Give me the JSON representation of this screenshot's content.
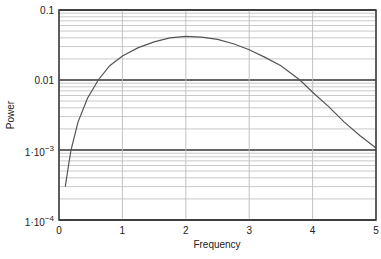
{
  "chart_data": {
    "type": "line",
    "title": "",
    "xlabel": "Frequency",
    "ylabel": "Power",
    "xlim": [
      0,
      5
    ],
    "ylim": [
      0.0001,
      0.1
    ],
    "yscale": "log",
    "grid": true,
    "legend": null,
    "x_ticks": [
      "0",
      "1",
      "2",
      "3",
      "4",
      "5"
    ],
    "y_ticks": [
      "0.1",
      "0.01",
      "1·10^-3",
      "1·10^-4"
    ],
    "series": [
      {
        "name": "Power spectrum",
        "x": [
          0.1,
          0.15,
          0.19,
          0.3,
          0.45,
          0.62,
          0.8,
          1.0,
          1.25,
          1.5,
          1.75,
          2.0,
          2.25,
          2.5,
          2.75,
          3.0,
          3.25,
          3.5,
          3.8,
          4.0,
          4.25,
          4.5,
          4.75,
          5.0
        ],
        "values": [
          0.0003,
          0.0006,
          0.001,
          0.0025,
          0.0055,
          0.01,
          0.016,
          0.022,
          0.029,
          0.035,
          0.04,
          0.042,
          0.041,
          0.038,
          0.033,
          0.027,
          0.021,
          0.016,
          0.01,
          0.0067,
          0.0042,
          0.0025,
          0.0016,
          0.00107
        ]
      }
    ]
  },
  "labels": {
    "x_axis": "Frequency",
    "y_axis": "Power",
    "x_ticks": [
      "0",
      "1",
      "2",
      "3",
      "4",
      "5"
    ],
    "y_tick_0": "0.1",
    "y_tick_1": "0.01",
    "y_tick_2_base": "1·10",
    "y_tick_2_exp": "−3",
    "y_tick_3_base": "1·10",
    "y_tick_3_exp": "−4"
  },
  "colors": {
    "curve": "#555555",
    "major_grid": "#333333",
    "minor_grid": "#bbbbbb",
    "frame": "#333333"
  }
}
